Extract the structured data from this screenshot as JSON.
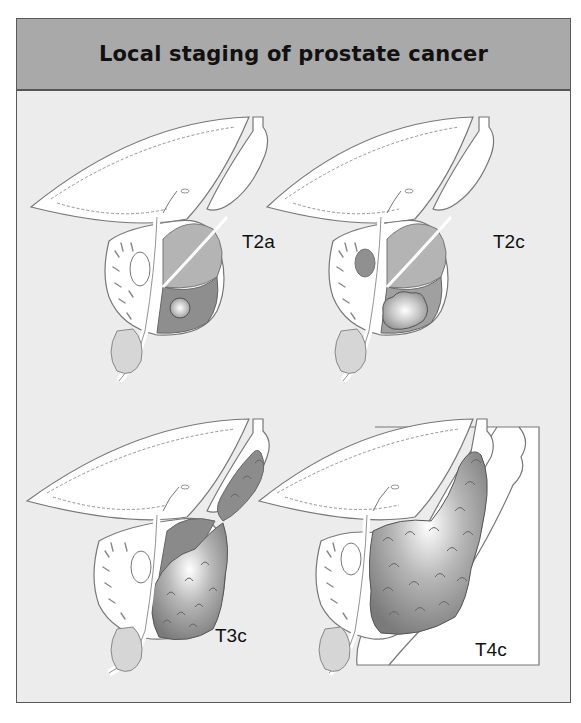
{
  "figure": {
    "title": "Local staging of prostate cancer",
    "colors": {
      "header_bg": "#a9a9a9",
      "panel_bg": "#ececec",
      "organ_fill": "#ffffff",
      "gland_fill": "#a8a8a8",
      "gland_dark": "#8c8c8c",
      "tumor_fill": "#8a8a8a",
      "outline": "#777777"
    },
    "panels": [
      {
        "stage": "T2a",
        "description": "Small tumour nodule confined to one lobe"
      },
      {
        "stage": "T2c",
        "description": "Tumour involving both lobes, confined to prostate"
      },
      {
        "stage": "T3c",
        "description": "Tumour extending into seminal vesicle"
      },
      {
        "stage": "T4c",
        "description": "Tumour invading adjacent structures (rectal wall)"
      }
    ]
  }
}
